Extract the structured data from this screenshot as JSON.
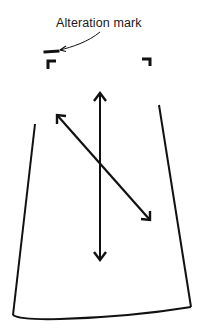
{
  "diagram": {
    "type": "skirt-pattern-alteration",
    "annotation": {
      "label": "Alteration mark"
    },
    "elements": {
      "outline": "skirt-panel-outline",
      "grainline": "vertical-double-arrow",
      "bias": "diagonal-double-arrow",
      "corner_marks": [
        "left-corner-mark",
        "right-corner-mark"
      ],
      "alteration_mark": "dash-mark"
    },
    "colors": {
      "stroke": "#111111",
      "background": "#ffffff"
    }
  }
}
